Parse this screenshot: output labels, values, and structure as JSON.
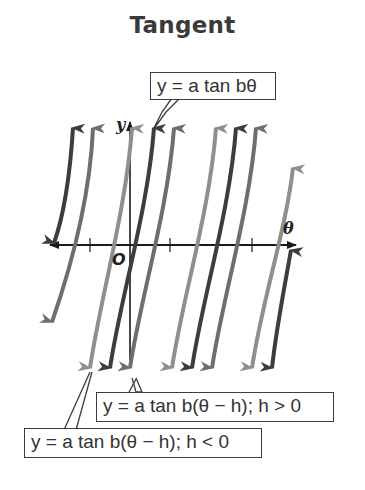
{
  "title": "Tangent",
  "axes": {
    "x_label": "θ",
    "y_label": "y",
    "origin_label": "O"
  },
  "callouts": {
    "parent": "y = a tan bθ",
    "shift_positive": "y = a tan b(θ − h); h > 0",
    "shift_negative": "y = a tan b(θ − h); h < 0"
  },
  "colors": {
    "parent_curve": "#6e6e6e",
    "shift_positive_curve": "#3d3d3d",
    "shift_negative_curve": "#8f8f8f",
    "axis": "#1a1a1a",
    "callout_border": "#3c3c3c"
  },
  "legend": [
    {
      "family": "parent",
      "equation": "y = a tan bθ",
      "shade": "medium gray"
    },
    {
      "family": "shift_positive",
      "equation": "y = a tan b(θ − h); h > 0",
      "shade": "dark gray"
    },
    {
      "family": "shift_negative",
      "equation": "y = a tan b(θ − h); h < 0",
      "shade": "light gray"
    }
  ]
}
